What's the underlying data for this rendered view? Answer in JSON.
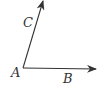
{
  "diagram": {
    "type": "angle",
    "colors": {
      "stroke": "#333333",
      "background": "#ffffff"
    },
    "points": {
      "A": {
        "label": "A",
        "x": 23,
        "y": 68
      },
      "B_tip": {
        "x": 96,
        "y": 69
      },
      "C_tip": {
        "x": 43,
        "y": 1
      }
    },
    "rays": [
      {
        "from": "A",
        "to": "B",
        "arrow": true
      },
      {
        "from": "A",
        "to": "C",
        "arrow": true
      }
    ],
    "labels": {
      "A": "A",
      "B": "B",
      "C": "C"
    }
  }
}
